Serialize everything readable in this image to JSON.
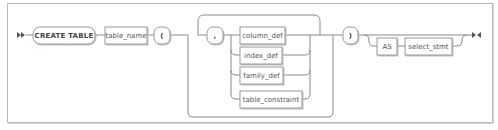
{
  "diagram": {
    "type": "railroad-syntax-diagram",
    "start_marker": "double-arrow-start",
    "end_marker": "arrow-bar-end",
    "nodes": {
      "create_table": "CREATE TABLE",
      "table_name": "table_name",
      "open_paren": "(",
      "comma": ",",
      "column_def": "column_def",
      "index_def": "index_def",
      "family_def": "family_def",
      "table_constraint": "table_constraint",
      "close_paren": ")",
      "as": "AS",
      "select_stmt": "select_stmt"
    },
    "colors": {
      "line": "#8a8a8a",
      "box_border": "#9a9a9a",
      "box_fill": "#ffffff",
      "text": "#555555",
      "frame": "#b8b8b8"
    }
  }
}
